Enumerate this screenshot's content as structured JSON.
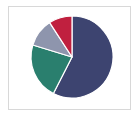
{
  "chart_data": {
    "type": "pie",
    "title": "",
    "subtitle": "",
    "xlabel": "",
    "ylabel": "",
    "legend": "none",
    "grid": false,
    "labels": [
      "Series 1",
      "Series 2",
      "Series 3",
      "Series 4"
    ],
    "values": [
      57.5,
      22.2,
      11.1,
      9.2
    ],
    "colors": [
      "#3d4470",
      "#2a7f6e",
      "#8e95ad",
      "#c0203f"
    ],
    "start_angle_deg": 0,
    "direction": "clockwise",
    "slices": [
      {
        "label": "Series 1",
        "value": 57.5,
        "color": "#3d4470",
        "start_deg": 0,
        "end_deg": 207
      },
      {
        "label": "Series 2",
        "value": 22.2,
        "color": "#2a7f6e",
        "start_deg": 207,
        "end_deg": 287
      },
      {
        "label": "Series 3",
        "value": 11.1,
        "color": "#8e95ad",
        "start_deg": 287,
        "end_deg": 327
      },
      {
        "label": "Series 4",
        "value": 9.2,
        "color": "#c0203f",
        "start_deg": 327,
        "end_deg": 360
      }
    ],
    "center_x": 72,
    "center_y": 57,
    "radius": 41,
    "slice_border_color": "#ffffff",
    "slice_border_width": 1.2,
    "background_color": "#ffffff",
    "frame_color": "#d8d8d8"
  }
}
